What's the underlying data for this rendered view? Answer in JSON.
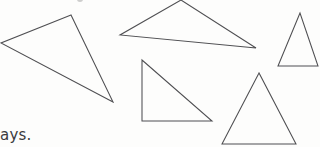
{
  "page": {
    "kind": "scanned-worksheet-fragment",
    "width": 320,
    "height": 147,
    "background_color": "#fdfdfc",
    "ink_color": "#4f4f52",
    "text_color": "#3b3b3e"
  },
  "text": {
    "cut_word_fragment": "ays.",
    "faint_top_mark_label": ""
  },
  "figures": {
    "count": 5,
    "stroke_color": "#4f4f52",
    "stroke_width": 1.05,
    "fill": "none",
    "shapes": [
      {
        "id": "triangle-1",
        "name": "large-obtuse-triangle-left",
        "label": "Triangle 1",
        "points": "71,15 1,43 113,102",
        "vertices": [
          [
            71,
            15
          ],
          [
            1,
            43
          ],
          [
            113,
            102
          ]
        ]
      },
      {
        "id": "triangle-2",
        "name": "wide-flat-triangle-top",
        "label": "Triangle 2",
        "points": "181,0 120,35 256,48",
        "vertices": [
          [
            181,
            0
          ],
          [
            120,
            35
          ],
          [
            256,
            48
          ]
        ]
      },
      {
        "id": "triangle-3",
        "name": "narrow-tall-triangle-right",
        "label": "Triangle 3",
        "points": "300,13 278,66 318,66",
        "vertices": [
          [
            300,
            13
          ],
          [
            278,
            66
          ],
          [
            318,
            66
          ]
        ]
      },
      {
        "id": "triangle-4",
        "name": "right-angle-triangle-center",
        "label": "Triangle 4",
        "points": "142,60 142,121 212,121",
        "vertices": [
          [
            142,
            60
          ],
          [
            142,
            121
          ],
          [
            212,
            121
          ]
        ]
      },
      {
        "id": "triangle-5",
        "name": "equilateral-triangle-bottom-right",
        "label": "Triangle 5",
        "points": "259,73 222,144 296,144",
        "vertices": [
          [
            259,
            73
          ],
          [
            222,
            144
          ],
          [
            296,
            144
          ]
        ]
      }
    ]
  }
}
